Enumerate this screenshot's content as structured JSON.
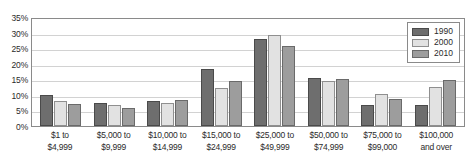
{
  "chart_data": {
    "type": "bar",
    "title": "",
    "xlabel": "",
    "ylabel": "",
    "ylim": [
      0,
      35
    ],
    "ytick_labels": [
      "35%",
      "30%",
      "25%",
      "20%",
      "15%",
      "10%",
      "5%",
      "0%"
    ],
    "ytick_values": [
      35,
      30,
      25,
      20,
      15,
      10,
      5,
      0
    ],
    "grid": true,
    "legend_position": "top-right",
    "categories": [
      [
        "$1 to",
        "$4,999"
      ],
      [
        "$5,000 to",
        "$9,999"
      ],
      [
        "$10,000 to",
        "$14,999"
      ],
      [
        "$15,000 to",
        "$24,999"
      ],
      [
        "$25,000 to",
        "$49,999"
      ],
      [
        "$50,000 to",
        "$74,999"
      ],
      [
        "$75,000 to",
        "$99,000"
      ],
      [
        "$100,000",
        "and over"
      ]
    ],
    "series": [
      {
        "name": "1990",
        "color": "#6e6e6e",
        "values": [
          9.9,
          7.5,
          8.0,
          18.3,
          28.0,
          15.4,
          6.6,
          6.8
        ]
      },
      {
        "name": "2000",
        "color": "#e2e2e2",
        "values": [
          8.1,
          6.8,
          7.4,
          12.3,
          29.2,
          14.3,
          10.2,
          12.4
        ]
      },
      {
        "name": "2010",
        "color": "#9d9d9d",
        "values": [
          7.0,
          5.9,
          8.4,
          14.6,
          25.6,
          15.1,
          8.7,
          14.9
        ]
      }
    ]
  }
}
